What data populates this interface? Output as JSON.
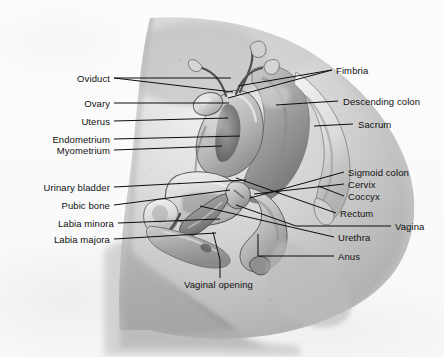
{
  "figure": {
    "kind": "anatomical-illustration",
    "rendering": "grayscale halftone photograph of an anatomical model",
    "background_color": "#fbfbfb",
    "label_color": "#111111",
    "leader_line_color": "#0d0d0d"
  },
  "labels": {
    "left": [
      {
        "text": "Oviduct",
        "x": 110,
        "y": 74,
        "line": [
          [
            114,
            78
          ],
          [
            231,
            78
          ],
          [
            231,
            78
          ]
        ]
      },
      {
        "text": "Ovary",
        "x": 110,
        "y": 99,
        "line": [
          [
            114,
            103
          ],
          [
            228,
            103
          ]
        ]
      },
      {
        "text": "Uterus",
        "x": 110,
        "y": 117,
        "line": [
          [
            114,
            121
          ],
          [
            228,
            121
          ]
        ]
      },
      {
        "text": "Endometrium",
        "x": 110,
        "y": 135,
        "line": [
          [
            114,
            139
          ],
          [
            238,
            139
          ]
        ]
      },
      {
        "text": "Myometrium",
        "x": 110,
        "y": 146,
        "line": [
          [
            114,
            150
          ],
          [
            222,
            150
          ]
        ]
      },
      {
        "text": "Urinary bladder",
        "x": 110,
        "y": 183,
        "line": [
          [
            114,
            187
          ],
          [
            245,
            187
          ]
        ]
      },
      {
        "text": "Pubic bone",
        "x": 110,
        "y": 201,
        "line": [
          [
            114,
            205
          ],
          [
            228,
            205
          ]
        ]
      },
      {
        "text": "Labia minora",
        "x": 110,
        "y": 219,
        "line": [
          [
            118,
            223
          ],
          [
            218,
            223
          ]
        ]
      },
      {
        "text": "Labia majora",
        "x": 110,
        "y": 235,
        "line": [
          [
            114,
            239
          ],
          [
            215,
            239
          ]
        ]
      }
    ],
    "right": [
      {
        "text": "Fimbria",
        "x": 336,
        "y": 66,
        "line": [
          [
            332,
            70
          ],
          [
            243,
            70
          ]
        ]
      },
      {
        "text": "Descending colon",
        "x": 343,
        "y": 97,
        "line": [
          [
            338,
            101
          ],
          [
            278,
            101
          ]
        ]
      },
      {
        "text": "Sacrum",
        "x": 358,
        "y": 120,
        "line": [
          [
            353,
            124
          ],
          [
            314,
            124
          ]
        ]
      },
      {
        "text": "Sigmoid colon",
        "x": 348,
        "y": 168,
        "line": [
          [
            344,
            172
          ],
          [
            298,
            172
          ]
        ]
      },
      {
        "text": "Cervix",
        "x": 348,
        "y": 180,
        "line": [
          [
            344,
            184
          ],
          [
            300,
            184
          ]
        ]
      },
      {
        "text": "Coccyx",
        "x": 348,
        "y": 192,
        "line": [
          [
            344,
            196
          ],
          [
            318,
            196
          ]
        ]
      },
      {
        "text": "Rectum",
        "x": 340,
        "y": 209,
        "line": [
          [
            336,
            213
          ],
          [
            300,
            213
          ]
        ]
      },
      {
        "text": "Vagina",
        "x": 395,
        "y": 222,
        "line": [
          [
            391,
            226
          ],
          [
            330,
            226
          ]
        ]
      },
      {
        "text": "Urethra",
        "x": 338,
        "y": 233,
        "line": [
          [
            334,
            237
          ],
          [
            312,
            237
          ]
        ]
      },
      {
        "text": "Anus",
        "x": 338,
        "y": 252,
        "line": [
          [
            334,
            256
          ],
          [
            310,
            256
          ]
        ]
      }
    ],
    "bottom": [
      {
        "text": "Vaginal opening",
        "x": 184,
        "y": 284,
        "line": [
          [
            220,
            280
          ],
          [
            220,
            272
          ]
        ]
      }
    ]
  },
  "leader_paths": {
    "oviduct_a": "M114,78 L231,78",
    "oviduct_b": "M114,78 L233,92",
    "ovary": "M114,103 L229,103",
    "uterus": "M114,121 L228,118",
    "endometrium": "M114,139 L240,136",
    "myometrium": "M114,150 L222,146",
    "urinary_bladder": "M114,187 L246,180",
    "pubic_bone": "M114,205 L230,190",
    "labia_minora": "M118,223 L220,219",
    "labia_majora": "M114,239 L216,233",
    "fimbria_a": "M332,70 L238,86",
    "fimbria_b": "M332,70 L228,98",
    "descending_colon": "M338,101 L276,105",
    "sacrum": "M353,124 L314,126",
    "sigmoid_colon": "M344,172 L250,198",
    "cervix": "M344,184 L254,194",
    "coccyx": "M344,196 L318,186",
    "rectum": "M336,213 L236,178",
    "vagina": "M391,226 L296,226 L236,205",
    "urethra": "M334,237 L200,206",
    "anus": "M334,256 L258,256 L258,234",
    "vaginal_opening": "M220,278 L220,260 L213,232"
  },
  "image_extent": {
    "left": 60,
    "top": 18,
    "right": 420,
    "bottom": 340
  }
}
